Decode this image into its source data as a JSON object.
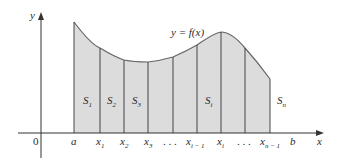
{
  "diagram": {
    "curve_label": "y = f(x)",
    "axis_labels": {
      "x": "x",
      "y": "y",
      "origin": "0"
    },
    "colors": {
      "fill": "#dcdcdc",
      "stroke": "#555555",
      "axis": "#333333",
      "text": "#2a2a2a"
    },
    "x_ticks": [
      {
        "id": "a",
        "text": "a",
        "sub": ""
      },
      {
        "id": "x1",
        "text": "x",
        "sub": "1"
      },
      {
        "id": "x2",
        "text": "x",
        "sub": "2"
      },
      {
        "id": "x3",
        "text": "x",
        "sub": "3"
      },
      {
        "id": "dots1",
        "text": ". . .",
        "sub": ""
      },
      {
        "id": "ximinus1",
        "text": "x",
        "sub": "i − 1"
      },
      {
        "id": "xi",
        "text": "x",
        "sub": "i"
      },
      {
        "id": "dots2",
        "text": ". . .",
        "sub": ""
      },
      {
        "id": "xnminus1",
        "text": "x",
        "sub": "n − 1"
      },
      {
        "id": "b",
        "text": "b",
        "sub": ""
      }
    ],
    "strips": [
      {
        "text": "S",
        "sub": "1"
      },
      {
        "text": "S",
        "sub": "2"
      },
      {
        "text": "S",
        "sub": "3"
      },
      {
        "text": "S",
        "sub": "i"
      },
      {
        "text": "S",
        "sub": "n"
      }
    ]
  }
}
